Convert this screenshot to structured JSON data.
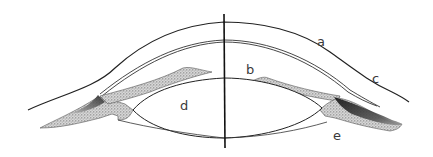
{
  "diagram": {
    "labels": {
      "a": "a",
      "b": "b",
      "c": "c",
      "d": "d",
      "e": "e"
    },
    "colors": {
      "line": "#222222",
      "stipple": "#9a9a9a",
      "background": "#ffffff"
    }
  }
}
